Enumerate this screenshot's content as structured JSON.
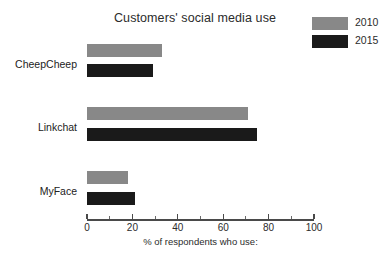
{
  "chart_data": {
    "type": "bar",
    "orientation": "horizontal",
    "title": "Customers' social media use",
    "xlabel": "% of respondents who use:",
    "ylabel": "",
    "categories": [
      "CheepCheep",
      "Linkchat",
      "MyFace"
    ],
    "series": [
      {
        "name": "2010",
        "color": "#888888",
        "values": [
          33,
          71,
          18
        ]
      },
      {
        "name": "2015",
        "color": "#1a1a1a",
        "values": [
          29,
          75,
          21
        ]
      }
    ],
    "xlim": [
      0,
      100
    ],
    "xticks": [
      0,
      20,
      40,
      60,
      80,
      100
    ],
    "xtick_labels": [
      "0",
      "20",
      "40",
      "60",
      "80",
      "100"
    ],
    "minor_xticks": [
      10,
      30,
      50,
      70,
      90
    ],
    "grid": false,
    "legend_position": "top-right"
  },
  "legend": {
    "entries": [
      {
        "label": "2010",
        "color": "#888888"
      },
      {
        "label": "2015",
        "color": "#1a1a1a"
      }
    ]
  },
  "axis": {
    "line_color": "#4a4a4a"
  }
}
